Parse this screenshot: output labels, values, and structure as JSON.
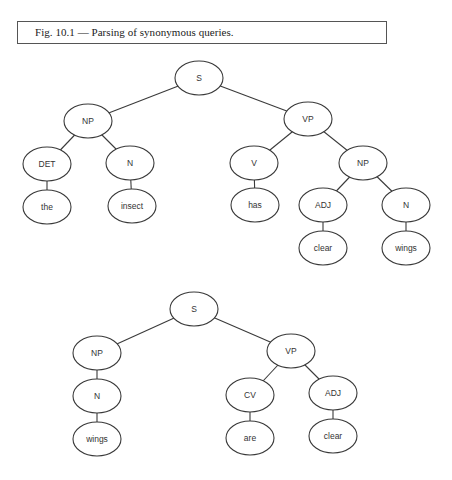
{
  "caption": {
    "text": "Fig. 10.1 — Parsing of synonymous queries."
  },
  "trees": [
    {
      "name": "parse-tree-1",
      "sentence": "the insect has clear wings",
      "nodes": [
        {
          "id": "s",
          "label": "S",
          "cx": 199,
          "cy": 78
        },
        {
          "id": "np",
          "label": "NP",
          "cx": 88,
          "cy": 121
        },
        {
          "id": "vp",
          "label": "VP",
          "cx": 308,
          "cy": 119
        },
        {
          "id": "det",
          "label": "DET",
          "cx": 47,
          "cy": 164
        },
        {
          "id": "n",
          "label": "N",
          "cx": 130,
          "cy": 163
        },
        {
          "id": "v",
          "label": "V",
          "cx": 254,
          "cy": 163
        },
        {
          "id": "np2",
          "label": "NP",
          "cx": 363,
          "cy": 163
        },
        {
          "id": "the",
          "label": "the",
          "cx": 47,
          "cy": 207
        },
        {
          "id": "insect",
          "label": "insect",
          "cx": 132,
          "cy": 206
        },
        {
          "id": "has",
          "label": "has",
          "cx": 255,
          "cy": 205
        },
        {
          "id": "adj",
          "label": "ADJ",
          "cx": 323,
          "cy": 205
        },
        {
          "id": "n2",
          "label": "N",
          "cx": 406,
          "cy": 205
        },
        {
          "id": "clear",
          "label": "clear",
          "cx": 323,
          "cy": 248
        },
        {
          "id": "wings",
          "label": "wings",
          "cx": 406,
          "cy": 248
        }
      ],
      "edges": [
        [
          "s",
          "np"
        ],
        [
          "s",
          "vp"
        ],
        [
          "np",
          "det"
        ],
        [
          "np",
          "n"
        ],
        [
          "det",
          "the"
        ],
        [
          "n",
          "insect"
        ],
        [
          "vp",
          "v"
        ],
        [
          "vp",
          "np2"
        ],
        [
          "v",
          "has"
        ],
        [
          "np2",
          "adj"
        ],
        [
          "np2",
          "n2"
        ],
        [
          "adj",
          "clear"
        ],
        [
          "n2",
          "wings"
        ]
      ]
    },
    {
      "name": "parse-tree-2",
      "sentence": "wings are clear",
      "nodes": [
        {
          "id": "s",
          "label": "S",
          "cx": 194,
          "cy": 309
        },
        {
          "id": "np",
          "label": "NP",
          "cx": 97,
          "cy": 353
        },
        {
          "id": "vp",
          "label": "VP",
          "cx": 291,
          "cy": 351
        },
        {
          "id": "n",
          "label": "N",
          "cx": 97,
          "cy": 396
        },
        {
          "id": "wings",
          "label": "wings",
          "cx": 97,
          "cy": 439
        },
        {
          "id": "cv",
          "label": "CV",
          "cx": 250,
          "cy": 395
        },
        {
          "id": "adj",
          "label": "ADJ",
          "cx": 333,
          "cy": 393
        },
        {
          "id": "are",
          "label": "are",
          "cx": 250,
          "cy": 438
        },
        {
          "id": "clear",
          "label": "clear",
          "cx": 333,
          "cy": 436
        }
      ],
      "edges": [
        [
          "s",
          "np"
        ],
        [
          "s",
          "vp"
        ],
        [
          "np",
          "n"
        ],
        [
          "n",
          "wings"
        ],
        [
          "vp",
          "cv"
        ],
        [
          "vp",
          "adj"
        ],
        [
          "cv",
          "are"
        ],
        [
          "adj",
          "clear"
        ]
      ]
    }
  ],
  "style": {
    "node_rx": 24,
    "node_ry": 17,
    "stroke_color": "#3a3a3a",
    "fill_color": "#ffffff"
  }
}
